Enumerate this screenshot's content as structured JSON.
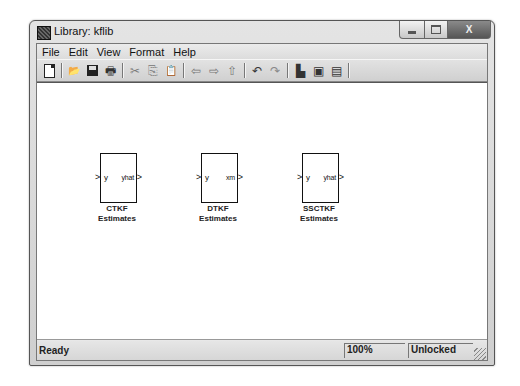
{
  "window": {
    "title": "Library: kflib",
    "controls": {
      "minimize": "minimize",
      "maximize": "maximize",
      "close": "X"
    }
  },
  "menu": {
    "items": [
      {
        "label": "File"
      },
      {
        "label": "Edit"
      },
      {
        "label": "View"
      },
      {
        "label": "Format"
      },
      {
        "label": "Help"
      }
    ]
  },
  "toolbar": {
    "buttons": [
      {
        "icon": "new-icon",
        "glyph": ""
      },
      {
        "icon": "open-icon",
        "glyph": "📂"
      },
      {
        "icon": "save-icon",
        "glyph": ""
      },
      {
        "icon": "print-icon",
        "glyph": "🖶"
      },
      {
        "icon": "cut-icon",
        "glyph": "✂"
      },
      {
        "icon": "copy-icon",
        "glyph": "⎘"
      },
      {
        "icon": "paste-icon",
        "glyph": "📋"
      },
      {
        "icon": "back-icon",
        "glyph": "⇦"
      },
      {
        "icon": "forward-icon",
        "glyph": "⇨"
      },
      {
        "icon": "up-icon",
        "glyph": "⇧"
      },
      {
        "icon": "undo-icon",
        "glyph": "↶"
      },
      {
        "icon": "redo-icon",
        "glyph": "↷"
      },
      {
        "icon": "library-browser-icon",
        "glyph": "▙"
      },
      {
        "icon": "model-explorer-icon",
        "glyph": "▣"
      },
      {
        "icon": "model-browser-icon",
        "glyph": "▤"
      }
    ]
  },
  "blocks": [
    {
      "name": "CTKF",
      "caption_line1": "CTKF",
      "caption_line2": "Estimates",
      "in_port": "y",
      "out_port": "yhat"
    },
    {
      "name": "DTKF",
      "caption_line1": "DTKF",
      "caption_line2": "Estimates",
      "in_port": "y",
      "out_port": "xm"
    },
    {
      "name": "SSCTKF",
      "caption_line1": "SSCTKF",
      "caption_line2": "Estimates",
      "in_port": "y",
      "out_port": "yhat"
    }
  ],
  "port_arrow_in": ">",
  "port_arrow_out": ">",
  "status": {
    "message": "Ready",
    "zoom": "100%",
    "lock_state": "Unlocked"
  }
}
